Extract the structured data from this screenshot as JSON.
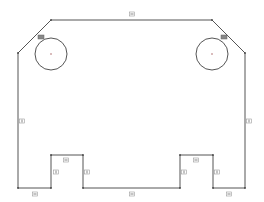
{
  "sketch": {
    "stroke_color": "#555555",
    "background": "#ffffff",
    "profile_points": [
      [
        51,
        20
      ],
      [
        212,
        20
      ],
      [
        245,
        53
      ],
      [
        245,
        188
      ],
      [
        213,
        188
      ],
      [
        213,
        155
      ],
      [
        180,
        155
      ],
      [
        180,
        188
      ],
      [
        83,
        188
      ],
      [
        83,
        155
      ],
      [
        51,
        155
      ],
      [
        51,
        188
      ],
      [
        18,
        188
      ],
      [
        18,
        53
      ]
    ],
    "circles": [
      {
        "name": "left-hole",
        "cx": 51,
        "cy": 54,
        "r": 16
      },
      {
        "name": "right-hole",
        "cx": 212,
        "cy": 54,
        "r": 16
      }
    ],
    "constraints": [
      {
        "type": "horizontal",
        "x": 132,
        "y": 14
      },
      {
        "type": "vertical",
        "x": 22,
        "y": 121
      },
      {
        "type": "vertical",
        "x": 249,
        "y": 121
      },
      {
        "type": "horizontal",
        "x": 66,
        "y": 160
      },
      {
        "type": "horizontal",
        "x": 196,
        "y": 160
      },
      {
        "type": "vertical",
        "x": 56,
        "y": 172
      },
      {
        "type": "vertical",
        "x": 87,
        "y": 172
      },
      {
        "type": "vertical",
        "x": 184,
        "y": 172
      },
      {
        "type": "vertical",
        "x": 217,
        "y": 172
      },
      {
        "type": "horizontal",
        "x": 35,
        "y": 194
      },
      {
        "type": "horizontal",
        "x": 132,
        "y": 194
      },
      {
        "type": "horizontal",
        "x": 229,
        "y": 194
      }
    ],
    "tangent_markers": [
      {
        "x": 41,
        "y": 37
      },
      {
        "x": 224,
        "y": 37
      }
    ]
  }
}
